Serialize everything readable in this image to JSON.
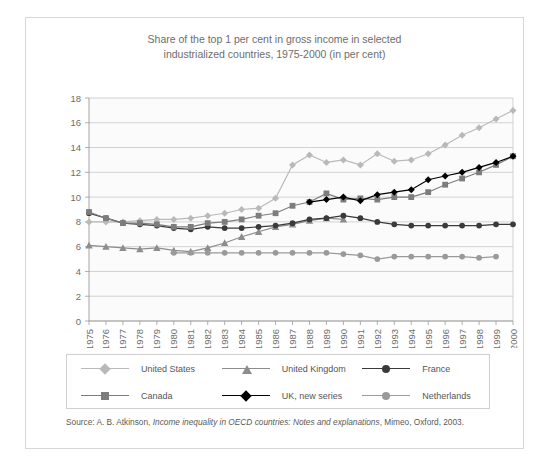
{
  "figure": {
    "tab_label": "Figure 17"
  },
  "chart_data": {
    "type": "line",
    "title": "Share of the top 1 per cent in gross income in selected industrialized countries, 1975-2000 (in per cent)",
    "title_line1": "Share of the top 1 per cent in gross income in selected",
    "title_line2": "industrialized countries, 1975-2000 (in per cent)",
    "xlabel": "",
    "ylabel": "",
    "ylim": [
      0,
      18
    ],
    "ytick_step": 2,
    "yticks": [
      0,
      2,
      4,
      6,
      8,
      10,
      12,
      14,
      16,
      18
    ],
    "grid": true,
    "legend_position": "bottom",
    "x": [
      1975,
      1976,
      1977,
      1978,
      1979,
      1980,
      1981,
      1982,
      1983,
      1984,
      1985,
      1986,
      1987,
      1988,
      1989,
      1990,
      1991,
      1992,
      1993,
      1994,
      1995,
      1996,
      1997,
      1998,
      1999,
      2000
    ],
    "categories": [
      "1975",
      "1976",
      "1977",
      "1978",
      "1979",
      "1980",
      "1981",
      "1982",
      "1983",
      "1984",
      "1985",
      "1986",
      "1987",
      "1988",
      "1989",
      "1990",
      "1991",
      "1992",
      "1993",
      "1994",
      "1995",
      "1996",
      "1997",
      "1998",
      "1999",
      "2000"
    ],
    "series": [
      {
        "name": "United States",
        "color": "#b9b9b9",
        "marker": "diamond",
        "values": [
          8.0,
          8.0,
          8.0,
          8.1,
          8.2,
          8.2,
          8.3,
          8.5,
          8.7,
          9.0,
          9.1,
          9.9,
          12.6,
          13.4,
          12.8,
          13.0,
          12.6,
          13.5,
          12.9,
          13.0,
          13.5,
          14.2,
          15.0,
          15.6,
          16.3,
          17.0
        ]
      },
      {
        "name": "United Kingdom",
        "color": "#8d8d8d",
        "marker": "triangle",
        "values": [
          6.1,
          6.0,
          5.9,
          5.8,
          5.9,
          5.7,
          5.6,
          5.9,
          6.3,
          6.8,
          7.2,
          7.6,
          7.8,
          8.1,
          8.3,
          8.2,
          null,
          null,
          null,
          null,
          null,
          null,
          null,
          null,
          null,
          null
        ]
      },
      {
        "name": "France",
        "color": "#3a3a3a",
        "marker": "circle",
        "values": [
          8.7,
          8.3,
          7.9,
          7.8,
          7.7,
          7.5,
          7.4,
          7.6,
          7.5,
          7.5,
          7.6,
          7.7,
          7.9,
          8.2,
          8.3,
          8.5,
          8.3,
          8.0,
          7.8,
          7.7,
          7.7,
          7.7,
          7.7,
          7.7,
          7.8,
          7.8
        ]
      },
      {
        "name": "Canada",
        "color": "#7d7d7d",
        "marker": "square",
        "values": [
          8.8,
          8.3,
          7.9,
          7.9,
          7.8,
          7.6,
          7.6,
          7.9,
          8.0,
          8.2,
          8.5,
          8.7,
          9.3,
          9.6,
          10.3,
          9.8,
          9.9,
          9.8,
          10.0,
          10.0,
          10.4,
          11.0,
          11.5,
          12.0,
          12.6,
          13.3
        ]
      },
      {
        "name": "UK, new series",
        "color": "#000000",
        "marker": "diamond",
        "values": [
          null,
          null,
          null,
          null,
          null,
          null,
          null,
          null,
          null,
          null,
          null,
          null,
          null,
          9.6,
          9.8,
          10.0,
          9.7,
          10.2,
          10.4,
          10.6,
          11.4,
          11.7,
          12.0,
          12.4,
          12.8,
          13.3
        ]
      },
      {
        "name": "Netherlands",
        "color": "#9a9a9a",
        "marker": "circle",
        "values": [
          null,
          null,
          null,
          null,
          null,
          5.5,
          5.5,
          5.5,
          5.5,
          5.5,
          5.5,
          5.5,
          5.5,
          5.5,
          5.5,
          5.4,
          5.3,
          5.0,
          5.2,
          5.2,
          5.2,
          5.2,
          5.2,
          5.1,
          5.2,
          null
        ]
      }
    ]
  },
  "source": {
    "prefix": "Source: A. B. Atkinson, ",
    "italic": "Income inequality in OECD countries: Notes and explanations",
    "suffix": ", Mimeo, Oxford, 2003."
  }
}
